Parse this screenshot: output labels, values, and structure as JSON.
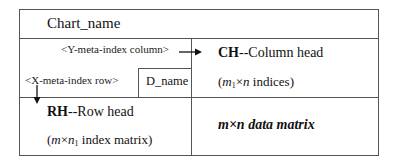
{
  "diagram": {
    "title": "Chart_name",
    "y_meta_index": "<Y-meta-index column>",
    "x_meta_index": "<X-meta-index row>",
    "d_name": "D_name",
    "column_head": {
      "abbr": "CH",
      "label": "--Column head",
      "detail_open": "(",
      "detail_m": "m",
      "detail_sub": "1",
      "detail_times": "×",
      "detail_n": "n",
      "detail_rest": " indices)"
    },
    "row_head": {
      "abbr": "RH",
      "label": "--Row head",
      "detail_open": "(",
      "detail_m": "m",
      "detail_times": "×",
      "detail_n": "n",
      "detail_sub": "1",
      "detail_rest": " index matrix)"
    },
    "data_matrix": "m×n data matrix",
    "colors": {
      "border": "#555555",
      "text": "#111111"
    }
  }
}
